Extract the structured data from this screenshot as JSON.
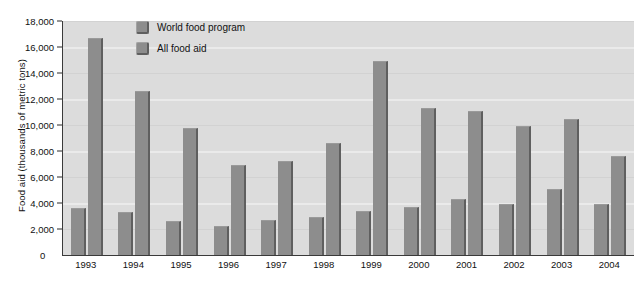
{
  "chart_data": {
    "type": "bar",
    "title": "",
    "xlabel": "",
    "ylabel": "Food aid (thousands of metric tons)",
    "ylim": [
      0,
      18000
    ],
    "ytick_labels": [
      "18,000",
      "16,000",
      "14,000",
      "12,000",
      "10,000",
      "8,000",
      "6,000",
      "4,000",
      "2,000",
      "0"
    ],
    "ytick_values": [
      18000,
      16000,
      14000,
      12000,
      10000,
      8000,
      6000,
      4000,
      2000,
      0
    ],
    "grid": true,
    "legend_position": "top-left-inside",
    "categories": [
      "1993",
      "1994",
      "1995",
      "1996",
      "1997",
      "1998",
      "1999",
      "2000",
      "2001",
      "2002",
      "2003",
      "2004"
    ],
    "series": [
      {
        "name": "World food program",
        "color": "#8d8d8d",
        "values": [
          3600,
          3300,
          2600,
          2200,
          2700,
          2900,
          3400,
          3700,
          4300,
          3900,
          5100,
          3900
        ]
      },
      {
        "name": "All food aid",
        "color": "#8d8d8d",
        "values": [
          16700,
          12600,
          9800,
          6900,
          7200,
          8600,
          14900,
          11300,
          11100,
          9900,
          10500,
          7600
        ]
      }
    ]
  },
  "legend": {
    "items": [
      {
        "label": "World food program"
      },
      {
        "label": "All food aid"
      }
    ]
  },
  "axes": {
    "zero_label": "0"
  },
  "colors": {
    "bar_fill": "#8d8d8d",
    "bar_edge": "#5f5f5f",
    "plot_background": "#dcdcdc",
    "gridline": "#eaeaea",
    "axis_line": "#3a3a3a",
    "text": "#111111"
  }
}
